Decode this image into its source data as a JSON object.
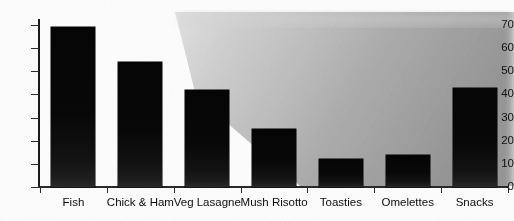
{
  "chart_data": {
    "type": "bar",
    "title": "",
    "xlabel": "",
    "ylabel": "",
    "categories": [
      "Fish",
      "Chick & Ham",
      "Veg Lasagne",
      "Mush Risotto",
      "Toasties",
      "Omelettes",
      "Snacks"
    ],
    "values": [
      69,
      54,
      42,
      25,
      12,
      14,
      43
    ],
    "ylim": [
      0,
      70
    ],
    "ytick_labels": [
      "70",
      "60",
      "50",
      "40",
      "30",
      "20",
      "10",
      "0"
    ],
    "ytick_values": [
      70,
      60,
      50,
      40,
      30,
      20,
      10,
      0
    ],
    "grid": false,
    "legend": null,
    "bar_color": "#080808",
    "axis_color": "#1b1b1b",
    "background_color": "#ffffff"
  },
  "appearance": {
    "scan_wedge_color": "#9a9a9a",
    "note": ""
  }
}
